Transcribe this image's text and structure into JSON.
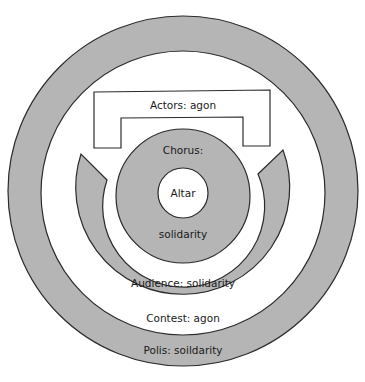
{
  "diagram": {
    "colors": {
      "fill": "#b5b5b5",
      "stroke": "#2b2b2b",
      "background": "#ffffff"
    },
    "labels": {
      "actors": "Actors: agon",
      "chorus_top": "Chorus:",
      "altar": "Altar",
      "chorus_bottom": "solidarity",
      "audience": "Audience: solidarity",
      "contest": "Contest: agon",
      "polis": "Polis: soildarity"
    },
    "regions": [
      {
        "name": "Polis",
        "quality": "soildarity",
        "shape": "outer ring"
      },
      {
        "name": "Contest",
        "quality": "agon",
        "shape": "white band"
      },
      {
        "name": "Audience",
        "quality": "solidarity",
        "shape": "horseshoe arc"
      },
      {
        "name": "Actors",
        "quality": "agon",
        "shape": "bracket"
      },
      {
        "name": "Chorus",
        "quality": "solidarity",
        "shape": "ring"
      },
      {
        "name": "Altar",
        "quality": "",
        "shape": "center circle"
      }
    ]
  }
}
